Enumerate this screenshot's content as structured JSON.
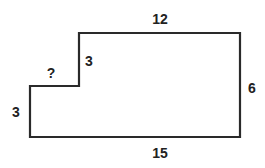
{
  "diagram": {
    "type": "composite-rectangle-figure",
    "colors": {
      "stroke": "#2a2a2a",
      "text": "#222222",
      "background": "#ffffff"
    },
    "stroke_width": 2.2,
    "font_size": 14,
    "outline_points": [
      [
        30,
        86
      ],
      [
        79,
        86
      ],
      [
        79,
        33
      ],
      [
        240,
        33
      ],
      [
        240,
        137
      ],
      [
        30,
        137
      ]
    ],
    "labels": {
      "top": {
        "text": "12",
        "x": 160,
        "y": 19,
        "describes": "top edge length"
      },
      "bottom": {
        "text": "15",
        "x": 160,
        "y": 153,
        "describes": "bottom edge length"
      },
      "right": {
        "text": "6",
        "x": 252,
        "y": 88,
        "describes": "right edge height"
      },
      "left": {
        "text": "3",
        "x": 16,
        "y": 112,
        "describes": "left edge height"
      },
      "step_vertical": {
        "text": "3",
        "x": 89,
        "y": 61,
        "describes": "inner step vertical edge height"
      },
      "step_horizontal": {
        "text": "?",
        "x": 51,
        "y": 73,
        "describes": "unknown step horizontal edge length"
      }
    }
  }
}
